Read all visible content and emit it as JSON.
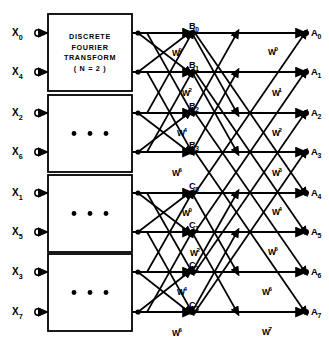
{
  "figure": {
    "line_color": "#000000",
    "background": "#ffffff"
  },
  "inputs": [
    {
      "label": "X",
      "sub": "0",
      "y": 33
    },
    {
      "label": "X",
      "sub": "4",
      "y": 72
    },
    {
      "label": "X",
      "sub": "2",
      "y": 113
    },
    {
      "label": "X",
      "sub": "6",
      "y": 152
    },
    {
      "label": "X",
      "sub": "1",
      "y": 193
    },
    {
      "label": "X",
      "sub": "5",
      "y": 232
    },
    {
      "label": "X",
      "sub": "3",
      "y": 272
    },
    {
      "label": "X",
      "sub": "7",
      "y": 312
    }
  ],
  "boxes": [
    {
      "name": "dft-box-1",
      "lines": [
        "DISCRETE",
        "FOURIER",
        "TRANSFORM",
        "( N = 2 )"
      ],
      "dots": false,
      "x": 48,
      "y": 14,
      "w": 84,
      "h": 77
    },
    {
      "name": "dft-box-2",
      "lines": [],
      "dots": true,
      "x": 48,
      "y": 95,
      "w": 84,
      "h": 77
    },
    {
      "name": "dft-box-3",
      "lines": [],
      "dots": true,
      "x": 48,
      "y": 175,
      "w": 84,
      "h": 77
    },
    {
      "name": "dft-box-4",
      "lines": [],
      "dots": true,
      "x": 48,
      "y": 254,
      "w": 84,
      "h": 77
    }
  ],
  "stage2_nodes": [
    {
      "label": "B",
      "sub": "0",
      "y": 33
    },
    {
      "label": "B",
      "sub": "1",
      "y": 72
    },
    {
      "label": "B",
      "sub": "2",
      "y": 113
    },
    {
      "label": "B",
      "sub": "3",
      "y": 152
    },
    {
      "label": "C",
      "sub": "0",
      "y": 193
    },
    {
      "label": "C",
      "sub": "1",
      "y": 232
    },
    {
      "label": "C",
      "sub": "2",
      "y": 272
    },
    {
      "label": "C",
      "sub": "3",
      "y": 312
    }
  ],
  "outputs": [
    {
      "label": "A",
      "sub": "0",
      "y": 33
    },
    {
      "label": "A",
      "sub": "1",
      "y": 72
    },
    {
      "label": "A",
      "sub": "2",
      "y": 113
    },
    {
      "label": "A",
      "sub": "3",
      "y": 152
    },
    {
      "label": "A",
      "sub": "4",
      "y": 193
    },
    {
      "label": "A",
      "sub": "5",
      "y": 232
    },
    {
      "label": "A",
      "sub": "6",
      "y": 272
    },
    {
      "label": "A",
      "sub": "7",
      "y": 312
    }
  ],
  "twiddles_stage2": [
    {
      "base": "W",
      "exp": "0",
      "x": 172,
      "y": 56
    },
    {
      "base": "W",
      "exp": "2",
      "x": 182,
      "y": 96
    },
    {
      "base": "W",
      "exp": "4",
      "x": 177,
      "y": 136
    },
    {
      "base": "W",
      "exp": "6",
      "x": 172,
      "y": 176
    },
    {
      "base": "W",
      "exp": "0",
      "x": 182,
      "y": 216
    },
    {
      "base": "W",
      "exp": "2",
      "x": 190,
      "y": 256
    },
    {
      "base": "W",
      "exp": "4",
      "x": 177,
      "y": 295
    },
    {
      "base": "W",
      "exp": "6",
      "x": 172,
      "y": 336
    }
  ],
  "twiddles_stage3": [
    {
      "base": "W",
      "exp": "0",
      "x": 268,
      "y": 55
    },
    {
      "base": "W",
      "exp": "1",
      "x": 272,
      "y": 96
    },
    {
      "base": "W",
      "exp": "2",
      "x": 272,
      "y": 136
    },
    {
      "base": "W",
      "exp": "3",
      "x": 272,
      "y": 176
    },
    {
      "base": "W",
      "exp": "4",
      "x": 272,
      "y": 215
    },
    {
      "base": "W",
      "exp": "5",
      "x": 268,
      "y": 255
    },
    {
      "base": "W",
      "exp": "6",
      "x": 262,
      "y": 295
    },
    {
      "base": "W",
      "exp": "7",
      "x": 262,
      "y": 335
    }
  ],
  "geometry": {
    "x_terminal": 38,
    "x_box_left": 48,
    "x_box_right": 132,
    "x_stage2_node": 193,
    "x_stage3_node": 306,
    "rows": [
      33,
      72,
      113,
      152,
      193,
      232,
      272,
      312
    ]
  }
}
